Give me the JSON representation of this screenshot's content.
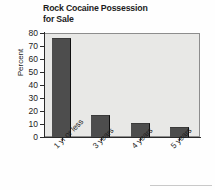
{
  "chart_data": {
    "type": "bar",
    "title": "Rock Cocaine Possession for Sale",
    "title_line1": "Rock Cocaine Possession",
    "title_line2": "for Sale",
    "xlabel": "",
    "ylabel": "Percent",
    "categories": [
      "1 yr or less",
      "3 years",
      "4 years",
      "5 years"
    ],
    "values": [
      76,
      17,
      11,
      8
    ],
    "ylim": [
      0,
      80
    ],
    "ytick_step": 10,
    "yticks": [
      80,
      70,
      60,
      50,
      40,
      30,
      20,
      10,
      0
    ],
    "grid": false,
    "legend": null,
    "bar_color": "#4d4d4d",
    "plot_background": "#e8e8e6",
    "axis_color": "#2b2b2b",
    "text_color": "#1c1c1c"
  }
}
